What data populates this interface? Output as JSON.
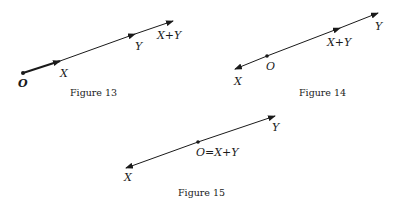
{
  "figures": [
    {
      "caption": "Figure 13",
      "labels": {
        "origin": "O",
        "x": "X",
        "y": "Y",
        "sum": "X+Y"
      }
    },
    {
      "caption": "Figure 14",
      "labels": {
        "origin": "O",
        "x": "X",
        "y": "Y",
        "sum": "X+Y"
      }
    },
    {
      "caption": "Figure 15",
      "labels": {
        "origin_sum": "O=X+Y",
        "x": "X",
        "y": "Y"
      }
    }
  ],
  "colors": {
    "ink": "#1a1a1a",
    "background": "#ffffff"
  }
}
